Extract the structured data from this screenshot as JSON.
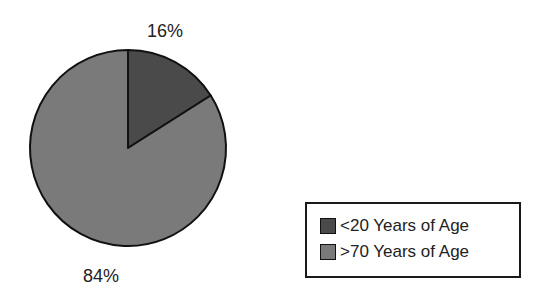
{
  "chart_data": {
    "type": "pie",
    "title": "",
    "categories": [
      "<20 Years of Age",
      ">70 Years of Age"
    ],
    "values": [
      16,
      84
    ],
    "labels": [
      "16%",
      "84%"
    ],
    "colors": [
      "#4a4a4a",
      "#7a7a7a"
    ],
    "start_angle": "12 o'clock, clockwise",
    "legend_position": "lower right"
  },
  "legend": {
    "items": [
      {
        "label": "<20 Years of Age",
        "color": "#4a4a4a"
      },
      {
        "label": ">70 Years of Age",
        "color": "#7a7a7a"
      }
    ]
  }
}
